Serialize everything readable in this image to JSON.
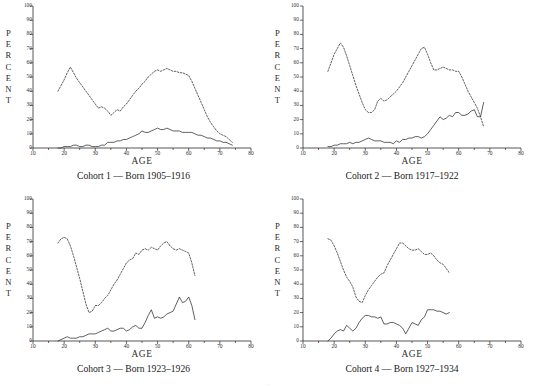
{
  "figure": {
    "axis_label_x": "AGE",
    "percent_letters": [
      "P",
      "E",
      "R",
      "C",
      "E",
      "N",
      "T"
    ],
    "ghost_caption": "."
  },
  "chart_data": [
    {
      "type": "line",
      "title": "Cohort 1 — Born 1905–1916",
      "xlabel": "AGE",
      "ylabel": "PERCENT",
      "xlim": [
        10,
        80
      ],
      "ylim": [
        0,
        100
      ],
      "xticks": [
        10,
        20,
        30,
        40,
        50,
        60,
        70,
        80
      ],
      "yticks": [
        0,
        10,
        20,
        30,
        40,
        50,
        60,
        70,
        80,
        90,
        100
      ],
      "grid": false,
      "legend": "none",
      "series": [
        {
          "name": "upper-dashed",
          "style": "dashed",
          "x": [
            18,
            19,
            20,
            21,
            22,
            23,
            24,
            25,
            26,
            27,
            28,
            29,
            30,
            31,
            32,
            33,
            34,
            35,
            36,
            37,
            38,
            39,
            40,
            41,
            42,
            43,
            44,
            45,
            46,
            47,
            48,
            49,
            50,
            51,
            52,
            53,
            54,
            55,
            56,
            57,
            58,
            59,
            60,
            61,
            62,
            63,
            64,
            65,
            66,
            67,
            68,
            69,
            70,
            71,
            72,
            73,
            74
          ],
          "y": [
            40,
            44,
            48,
            53,
            57,
            53,
            49,
            46,
            43,
            40,
            37,
            34,
            31,
            28,
            29,
            28,
            26,
            23,
            25,
            27,
            26,
            29,
            31,
            34,
            37,
            40,
            42,
            45,
            47,
            50,
            52,
            54,
            55,
            54,
            55,
            56,
            55,
            54,
            54,
            53,
            53,
            52,
            51,
            47,
            42,
            37,
            32,
            27,
            22,
            18,
            15,
            12,
            10,
            9,
            8,
            6,
            4
          ]
        },
        {
          "name": "lower-solid",
          "style": "solid",
          "x": [
            18,
            19,
            20,
            21,
            22,
            23,
            24,
            25,
            26,
            27,
            28,
            29,
            30,
            31,
            32,
            33,
            34,
            35,
            36,
            37,
            38,
            39,
            40,
            41,
            42,
            43,
            44,
            45,
            46,
            47,
            48,
            49,
            50,
            51,
            52,
            53,
            54,
            55,
            56,
            57,
            58,
            59,
            60,
            61,
            62,
            63,
            64,
            65,
            66,
            67,
            68,
            69,
            70,
            71,
            72,
            73,
            74
          ],
          "y": [
            0,
            0,
            1,
            1,
            1,
            2,
            2,
            1,
            1,
            2,
            2,
            1,
            1,
            1,
            2,
            2,
            4,
            4,
            4,
            5,
            5,
            6,
            6,
            7,
            8,
            9,
            10,
            12,
            11,
            11,
            12,
            13,
            14,
            13,
            13,
            14,
            13,
            12,
            12,
            12,
            11,
            11,
            11,
            11,
            10,
            9,
            9,
            8,
            7,
            7,
            6,
            5,
            5,
            4,
            4,
            3,
            2
          ]
        }
      ]
    },
    {
      "type": "line",
      "title": "Cohort 2 — Born 1917–1922",
      "xlabel": "AGE",
      "ylabel": "PERCENT",
      "xlim": [
        10,
        80
      ],
      "ylim": [
        0,
        100
      ],
      "xticks": [
        10,
        20,
        30,
        40,
        50,
        60,
        70,
        80
      ],
      "yticks": [
        0,
        10,
        20,
        30,
        40,
        50,
        60,
        70,
        80,
        90,
        100
      ],
      "grid": false,
      "legend": "none",
      "series": [
        {
          "name": "upper-dashed",
          "style": "dashed",
          "x": [
            18,
            19,
            20,
            21,
            22,
            23,
            24,
            25,
            26,
            27,
            28,
            29,
            30,
            31,
            32,
            33,
            34,
            35,
            36,
            37,
            38,
            39,
            40,
            41,
            42,
            43,
            44,
            45,
            46,
            47,
            48,
            49,
            50,
            51,
            52,
            53,
            54,
            55,
            56,
            57,
            58,
            59,
            60,
            61,
            62,
            63,
            64,
            65,
            66,
            67,
            68
          ],
          "y": [
            54,
            60,
            66,
            70,
            74,
            71,
            65,
            58,
            51,
            44,
            38,
            32,
            27,
            25,
            25,
            27,
            33,
            35,
            33,
            34,
            36,
            38,
            40,
            43,
            46,
            50,
            54,
            58,
            62,
            66,
            70,
            71,
            66,
            60,
            55,
            55,
            56,
            57,
            56,
            55,
            55,
            54,
            54,
            50,
            45,
            40,
            36,
            32,
            28,
            22,
            15
          ]
        },
        {
          "name": "lower-solid",
          "style": "solid",
          "x": [
            18,
            19,
            20,
            21,
            22,
            23,
            24,
            25,
            26,
            27,
            28,
            29,
            30,
            31,
            32,
            33,
            34,
            35,
            36,
            37,
            38,
            39,
            40,
            41,
            42,
            43,
            44,
            45,
            46,
            47,
            48,
            49,
            50,
            51,
            52,
            53,
            54,
            55,
            56,
            57,
            58,
            59,
            60,
            61,
            62,
            63,
            64,
            65,
            66,
            67,
            68
          ],
          "y": [
            1,
            1,
            2,
            2,
            3,
            3,
            3,
            4,
            3,
            4,
            4,
            5,
            6,
            7,
            6,
            5,
            5,
            5,
            4,
            4,
            4,
            3,
            5,
            4,
            6,
            6,
            7,
            7,
            8,
            8,
            7,
            8,
            10,
            13,
            16,
            19,
            22,
            20,
            21,
            23,
            22,
            25,
            25,
            23,
            23,
            24,
            26,
            27,
            22,
            22,
            32
          ]
        }
      ]
    },
    {
      "type": "line",
      "title": "Cohort 3 — Born 1923–1926",
      "xlabel": "AGE",
      "ylabel": "PERCENT",
      "xlim": [
        10,
        80
      ],
      "ylim": [
        0,
        100
      ],
      "xticks": [
        10,
        20,
        30,
        40,
        50,
        60,
        70,
        80
      ],
      "yticks": [
        0,
        10,
        20,
        30,
        40,
        50,
        60,
        70,
        80,
        90,
        100
      ],
      "grid": false,
      "legend": "none",
      "series": [
        {
          "name": "upper-dashed",
          "style": "dashed",
          "x": [
            18,
            19,
            20,
            21,
            22,
            23,
            24,
            25,
            26,
            27,
            28,
            29,
            30,
            31,
            32,
            33,
            34,
            35,
            36,
            37,
            38,
            39,
            40,
            41,
            42,
            43,
            44,
            45,
            46,
            47,
            48,
            49,
            50,
            51,
            52,
            53,
            54,
            55,
            56,
            57,
            58,
            59,
            60,
            61,
            62
          ],
          "y": [
            69,
            72,
            73,
            72,
            67,
            60,
            52,
            44,
            35,
            26,
            20,
            21,
            25,
            25,
            27,
            30,
            32,
            36,
            40,
            43,
            47,
            51,
            55,
            57,
            58,
            62,
            61,
            64,
            65,
            64,
            66,
            65,
            64,
            67,
            69,
            70,
            67,
            65,
            64,
            65,
            64,
            63,
            62,
            55,
            46
          ]
        },
        {
          "name": "lower-solid",
          "style": "solid",
          "x": [
            18,
            19,
            20,
            21,
            22,
            23,
            24,
            25,
            26,
            27,
            28,
            29,
            30,
            31,
            32,
            33,
            34,
            35,
            36,
            37,
            38,
            39,
            40,
            41,
            42,
            43,
            44,
            45,
            46,
            47,
            48,
            49,
            50,
            51,
            52,
            53,
            54,
            55,
            56,
            57,
            58,
            59,
            60,
            61,
            62
          ],
          "y": [
            0,
            1,
            2,
            3,
            2,
            2,
            2,
            3,
            3,
            4,
            5,
            5,
            5,
            6,
            7,
            8,
            9,
            7,
            7,
            8,
            9,
            9,
            7,
            8,
            10,
            11,
            9,
            9,
            13,
            18,
            22,
            16,
            17,
            16,
            17,
            19,
            20,
            21,
            26,
            31,
            27,
            28,
            31,
            25,
            15
          ]
        }
      ]
    },
    {
      "type": "line",
      "title": "Cohort 4 — Born 1927–1934",
      "xlabel": "AGE",
      "ylabel": "PERCENT",
      "xlim": [
        10,
        80
      ],
      "ylim": [
        0,
        100
      ],
      "xticks": [
        10,
        20,
        30,
        40,
        50,
        60,
        70,
        80
      ],
      "yticks": [
        0,
        10,
        20,
        30,
        40,
        50,
        60,
        70,
        80,
        90,
        100
      ],
      "grid": false,
      "legend": "none",
      "series": [
        {
          "name": "upper-dashed",
          "style": "dashed",
          "x": [
            18,
            19,
            20,
            21,
            22,
            23,
            24,
            25,
            26,
            27,
            28,
            29,
            30,
            31,
            32,
            33,
            34,
            35,
            36,
            37,
            38,
            39,
            40,
            41,
            42,
            43,
            44,
            45,
            46,
            47,
            48,
            49,
            50,
            51,
            52,
            53,
            54,
            55,
            56,
            57
          ],
          "y": [
            72,
            71,
            67,
            62,
            56,
            50,
            45,
            42,
            38,
            31,
            28,
            27,
            32,
            36,
            39,
            42,
            45,
            47,
            48,
            53,
            57,
            61,
            65,
            69,
            69,
            67,
            65,
            64,
            64,
            65,
            63,
            61,
            61,
            62,
            60,
            57,
            55,
            54,
            51,
            48
          ]
        },
        {
          "name": "lower-solid",
          "style": "solid",
          "x": [
            18,
            19,
            20,
            21,
            22,
            23,
            24,
            25,
            26,
            27,
            28,
            29,
            30,
            31,
            32,
            33,
            34,
            35,
            36,
            37,
            38,
            39,
            40,
            41,
            42,
            43,
            44,
            45,
            46,
            47,
            48,
            49,
            50,
            51,
            52,
            53,
            54,
            55,
            56,
            57
          ],
          "y": [
            0,
            2,
            5,
            7,
            8,
            7,
            11,
            9,
            7,
            9,
            13,
            16,
            18,
            18,
            17,
            17,
            16,
            17,
            12,
            12,
            13,
            13,
            12,
            11,
            9,
            5,
            9,
            13,
            12,
            11,
            15,
            17,
            22,
            22,
            22,
            21,
            21,
            20,
            19,
            20
          ]
        }
      ]
    }
  ]
}
